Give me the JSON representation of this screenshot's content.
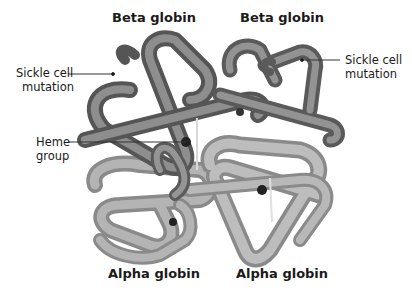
{
  "diagram": {
    "subunits": {
      "top_left": "Beta globin",
      "top_right": "Beta globin",
      "bottom_left": "Alpha globin",
      "bottom_right": "Alpha globin"
    },
    "callouts": {
      "sickle_left": {
        "line1": "Sickle cell",
        "line2": "mutation"
      },
      "sickle_right": {
        "line1": "Sickle cell",
        "line2": "mutation"
      },
      "heme": {
        "line1": "Heme",
        "line2": "group"
      }
    },
    "colors": {
      "beta_chain": "#6e6e6e",
      "alpha_chain": "#a8a8a8",
      "heme": "#222222",
      "leader_line": "#333333"
    }
  }
}
